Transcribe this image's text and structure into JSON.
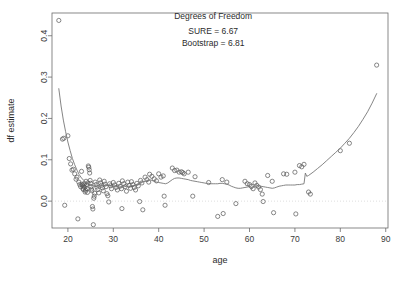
{
  "chart_data": {
    "type": "scatter",
    "title": "",
    "xlabel": "age",
    "ylabel": "df estimate",
    "xlim": [
      16.5,
      90.5
    ],
    "ylim": [
      -0.065,
      0.455
    ],
    "xticks": [
      20,
      30,
      40,
      50,
      60,
      70,
      80,
      90
    ],
    "xtick_labels": [
      "20",
      "30",
      "40",
      "50",
      "60",
      "70",
      "80",
      "90"
    ],
    "yticks": [
      0.0,
      0.1,
      0.2,
      0.3,
      0.4
    ],
    "ytick_labels": [
      "0.0",
      "0.1",
      "0.2",
      "0.3",
      "0.4"
    ],
    "grid": false,
    "legend": null,
    "reference_lines": [
      {
        "name": "zero-line",
        "orientation": "horizontal",
        "y": 0.0,
        "style": "dotted",
        "color": "#cfcfcf"
      }
    ],
    "annotations": [
      {
        "text": "Degrees of Freedom",
        "x": 52,
        "y": 0.44
      },
      {
        "text": "SURE = 6.67",
        "x": 52,
        "y": 0.405
      },
      {
        "text": "Bootstrap = 6.81",
        "x": 52,
        "y": 0.375
      }
    ],
    "point_marker": "open-circle",
    "point_color": "#555555",
    "curve_color": "#777777",
    "series": [
      {
        "name": "df estimate points",
        "type": "scatter",
        "points": [
          [
            18.0,
            0.437
          ],
          [
            18.8,
            0.15
          ],
          [
            19.1,
            0.152
          ],
          [
            19.3,
            -0.01
          ],
          [
            20.0,
            0.158
          ],
          [
            20.3,
            0.103
          ],
          [
            20.6,
            0.09
          ],
          [
            20.9,
            0.075
          ],
          [
            21.2,
            0.077
          ],
          [
            21.5,
            0.066
          ],
          [
            21.8,
            0.053
          ],
          [
            22.0,
            0.058
          ],
          [
            22.2,
            -0.043
          ],
          [
            22.4,
            0.046
          ],
          [
            22.6,
            0.04
          ],
          [
            22.8,
            0.035
          ],
          [
            23.0,
            0.072
          ],
          [
            23.1,
            0.041
          ],
          [
            23.2,
            0.038
          ],
          [
            23.3,
            0.031
          ],
          [
            23.4,
            0.028
          ],
          [
            23.5,
            0.036
          ],
          [
            23.6,
            0.042
          ],
          [
            23.7,
            0.033
          ],
          [
            23.8,
            0.022
          ],
          [
            23.9,
            0.026
          ],
          [
            24.0,
            0.048
          ],
          [
            24.1,
            0.039
          ],
          [
            24.2,
            0.03
          ],
          [
            24.3,
            0.021
          ],
          [
            24.4,
            0.044
          ],
          [
            24.5,
            0.085
          ],
          [
            24.6,
            0.082
          ],
          [
            24.7,
            0.076
          ],
          [
            24.8,
            0.068
          ],
          [
            24.9,
            0.05
          ],
          [
            25.0,
            0.043
          ],
          [
            25.1,
            0.035
          ],
          [
            25.2,
            0.029
          ],
          [
            25.3,
            0.025
          ],
          [
            25.4,
            -0.013
          ],
          [
            25.5,
            -0.019
          ],
          [
            25.6,
            -0.057
          ],
          [
            25.7,
            0.007
          ],
          [
            25.8,
            0.012
          ],
          [
            25.9,
            0.019
          ],
          [
            26.0,
            0.046
          ],
          [
            26.2,
            0.04
          ],
          [
            26.4,
            0.034
          ],
          [
            26.6,
            0.028
          ],
          [
            26.8,
            0.02
          ],
          [
            27.0,
            0.051
          ],
          [
            27.2,
            0.044
          ],
          [
            27.4,
            0.038
          ],
          [
            27.6,
            0.032
          ],
          [
            27.8,
            0.025
          ],
          [
            28.0,
            0.048
          ],
          [
            28.2,
            0.041
          ],
          [
            28.4,
            0.035
          ],
          [
            28.6,
            0.018
          ],
          [
            28.8,
            0.013
          ],
          [
            29.0,
            -0.002
          ],
          [
            29.2,
            0.042
          ],
          [
            29.4,
            0.037
          ],
          [
            29.6,
            0.03
          ],
          [
            30.0,
            0.045
          ],
          [
            30.3,
            0.039
          ],
          [
            30.6,
            0.033
          ],
          [
            30.9,
            0.027
          ],
          [
            31.2,
            0.043
          ],
          [
            31.5,
            0.036
          ],
          [
            31.8,
            0.03
          ],
          [
            31.9,
            -0.018
          ],
          [
            32.0,
            0.049
          ],
          [
            32.3,
            0.042
          ],
          [
            32.6,
            0.035
          ],
          [
            32.9,
            0.024
          ],
          [
            33.2,
            0.046
          ],
          [
            33.5,
            0.038
          ],
          [
            33.8,
            0.031
          ],
          [
            34.0,
            0.047
          ],
          [
            34.3,
            0.04
          ],
          [
            34.6,
            0.033
          ],
          [
            34.9,
            0.027
          ],
          [
            35.2,
            0.043
          ],
          [
            35.5,
            0.037
          ],
          [
            35.8,
            -0.001
          ],
          [
            36.0,
            0.05
          ],
          [
            36.3,
            0.044
          ],
          [
            36.5,
            -0.021
          ],
          [
            37.0,
            0.058
          ],
          [
            37.4,
            0.052
          ],
          [
            37.8,
            0.046
          ],
          [
            38.0,
            0.065
          ],
          [
            38.5,
            0.06
          ],
          [
            39.0,
            0.054
          ],
          [
            39.5,
            0.049
          ],
          [
            40.0,
            0.066
          ],
          [
            40.5,
            0.058
          ],
          [
            41.0,
            0.061
          ],
          [
            41.2,
            0.012
          ],
          [
            41.4,
            -0.01
          ],
          [
            43.0,
            0.08
          ],
          [
            43.5,
            0.074
          ],
          [
            44.0,
            0.075
          ],
          [
            44.5,
            0.07
          ],
          [
            45.0,
            0.071
          ],
          [
            45.3,
            0.069
          ],
          [
            45.6,
            0.066
          ],
          [
            46.5,
            0.07
          ],
          [
            47.5,
            0.012
          ],
          [
            48.0,
            0.059
          ],
          [
            51.0,
            0.045
          ],
          [
            53.0,
            -0.037
          ],
          [
            54.0,
            0.052
          ],
          [
            54.2,
            -0.03
          ],
          [
            55.0,
            0.046
          ],
          [
            57.0,
            -0.006
          ],
          [
            59.0,
            0.048
          ],
          [
            59.5,
            0.042
          ],
          [
            60.0,
            0.04
          ],
          [
            60.4,
            0.036
          ],
          [
            60.8,
            0.03
          ],
          [
            61.2,
            0.044
          ],
          [
            61.6,
            0.038
          ],
          [
            62.0,
            0.034
          ],
          [
            62.4,
            0.028
          ],
          [
            62.8,
            0.017
          ],
          [
            63.0,
            -0.001
          ],
          [
            64.0,
            0.062
          ],
          [
            65.0,
            0.048
          ],
          [
            65.3,
            -0.028
          ],
          [
            67.5,
            0.066
          ],
          [
            68.2,
            0.065
          ],
          [
            70.0,
            0.07
          ],
          [
            70.2,
            -0.031
          ],
          [
            71.0,
            0.086
          ],
          [
            71.5,
            0.083
          ],
          [
            72.0,
            0.089
          ],
          [
            73.0,
            0.022
          ],
          [
            73.4,
            0.017
          ],
          [
            80.0,
            0.122
          ],
          [
            82.0,
            0.14
          ],
          [
            88.0,
            0.329
          ]
        ]
      },
      {
        "name": "fitted smooth curve",
        "type": "line",
        "points": [
          [
            18.0,
            0.272
          ],
          [
            18.5,
            0.23
          ],
          [
            19.0,
            0.196
          ],
          [
            19.5,
            0.168
          ],
          [
            20.0,
            0.143
          ],
          [
            20.5,
            0.122
          ],
          [
            21.0,
            0.103
          ],
          [
            21.5,
            0.088
          ],
          [
            22.0,
            0.075
          ],
          [
            22.5,
            0.064
          ],
          [
            23.0,
            0.056
          ],
          [
            23.5,
            0.05
          ],
          [
            24.0,
            0.045
          ],
          [
            24.5,
            0.042
          ],
          [
            25.0,
            0.039
          ],
          [
            25.5,
            0.037
          ],
          [
            26.0,
            0.036
          ],
          [
            26.5,
            0.036
          ],
          [
            27.0,
            0.037
          ],
          [
            27.5,
            0.038
          ],
          [
            28.0,
            0.038
          ],
          [
            28.5,
            0.038
          ],
          [
            29.0,
            0.038
          ],
          [
            29.5,
            0.038
          ],
          [
            30.0,
            0.037
          ],
          [
            30.5,
            0.036
          ],
          [
            31.0,
            0.035
          ],
          [
            31.5,
            0.034
          ],
          [
            32.0,
            0.034
          ],
          [
            32.5,
            0.035
          ],
          [
            33.0,
            0.036
          ],
          [
            33.5,
            0.036
          ],
          [
            34.0,
            0.037
          ],
          [
            34.5,
            0.038
          ],
          [
            35.0,
            0.039
          ],
          [
            35.5,
            0.041
          ],
          [
            36.0,
            0.043
          ],
          [
            36.5,
            0.046
          ],
          [
            37.0,
            0.048
          ],
          [
            37.5,
            0.05
          ],
          [
            38.0,
            0.052
          ],
          [
            38.5,
            0.05
          ],
          [
            39.0,
            0.048
          ],
          [
            39.5,
            0.046
          ],
          [
            40.0,
            0.045
          ],
          [
            40.5,
            0.044
          ],
          [
            41.0,
            0.043
          ],
          [
            41.5,
            0.042
          ],
          [
            42.0,
            0.044
          ],
          [
            42.5,
            0.048
          ],
          [
            43.0,
            0.052
          ],
          [
            43.5,
            0.055
          ],
          [
            44.0,
            0.056
          ],
          [
            44.5,
            0.056
          ],
          [
            45.0,
            0.055
          ],
          [
            45.5,
            0.054
          ],
          [
            46.0,
            0.053
          ],
          [
            46.5,
            0.052
          ],
          [
            47.0,
            0.05
          ],
          [
            47.5,
            0.049
          ],
          [
            48.0,
            0.048
          ],
          [
            48.5,
            0.047
          ],
          [
            49.0,
            0.046
          ],
          [
            49.5,
            0.045
          ],
          [
            50.0,
            0.044
          ],
          [
            50.5,
            0.043
          ],
          [
            51.0,
            0.043
          ],
          [
            51.5,
            0.042
          ],
          [
            52.0,
            0.042
          ],
          [
            52.5,
            0.042
          ],
          [
            53.0,
            0.042
          ],
          [
            53.5,
            0.043
          ],
          [
            54.0,
            0.043
          ],
          [
            54.5,
            0.042
          ],
          [
            55.0,
            0.041
          ],
          [
            55.5,
            0.039
          ],
          [
            56.0,
            0.036
          ],
          [
            56.5,
            0.034
          ],
          [
            57.0,
            0.032
          ],
          [
            57.5,
            0.031
          ],
          [
            58.0,
            0.031
          ],
          [
            58.5,
            0.032
          ],
          [
            59.0,
            0.033
          ],
          [
            59.5,
            0.034
          ],
          [
            60.0,
            0.035
          ],
          [
            60.3,
            0.029
          ],
          [
            60.6,
            0.03
          ],
          [
            61.0,
            0.036
          ],
          [
            61.5,
            0.037
          ],
          [
            62.0,
            0.037
          ],
          [
            62.5,
            0.036
          ],
          [
            63.0,
            0.035
          ],
          [
            63.5,
            0.034
          ],
          [
            64.0,
            0.033
          ],
          [
            64.5,
            0.032
          ],
          [
            65.0,
            0.031
          ],
          [
            65.5,
            0.032
          ],
          [
            66.0,
            0.034
          ],
          [
            66.5,
            0.036
          ],
          [
            67.0,
            0.037
          ],
          [
            67.5,
            0.038
          ],
          [
            68.0,
            0.039
          ],
          [
            68.5,
            0.039
          ],
          [
            69.0,
            0.039
          ],
          [
            69.5,
            0.039
          ],
          [
            70.0,
            0.039
          ],
          [
            70.5,
            0.04
          ],
          [
            71.0,
            0.04
          ],
          [
            71.5,
            0.041
          ],
          [
            72.0,
            0.042
          ],
          [
            72.3,
            0.068
          ],
          [
            72.6,
            0.06
          ],
          [
            73.0,
            0.062
          ],
          [
            74.0,
            0.07
          ],
          [
            75.0,
            0.079
          ],
          [
            76.0,
            0.088
          ],
          [
            77.0,
            0.098
          ],
          [
            78.0,
            0.108
          ],
          [
            79.0,
            0.118
          ],
          [
            80.0,
            0.128
          ],
          [
            81.0,
            0.14
          ],
          [
            82.0,
            0.152
          ],
          [
            83.0,
            0.166
          ],
          [
            84.0,
            0.181
          ],
          [
            85.0,
            0.198
          ],
          [
            86.0,
            0.216
          ],
          [
            87.0,
            0.237
          ],
          [
            88.0,
            0.26
          ]
        ]
      }
    ]
  }
}
